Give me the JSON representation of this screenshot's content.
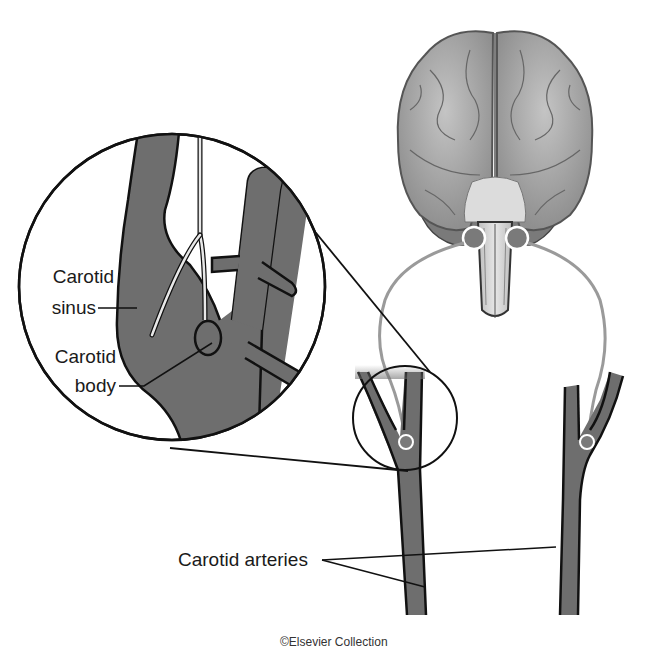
{
  "diagram": {
    "labels": {
      "carotid_sinus_line1": "Carotid",
      "carotid_sinus_line2": "sinus",
      "carotid_body_line1": "Carotid",
      "carotid_body_line2": "body",
      "carotid_arteries": "Carotid arteries"
    },
    "credit": "©Elsevier Collection",
    "colors": {
      "artery_fill": "#6e6e6e",
      "outline": "#111111",
      "nerve": "#9a9a9a",
      "brain_fill": "#a8a8a8",
      "brain_light": "#c9c9c9",
      "brainstem": "#d8d8d8",
      "background": "#ffffff"
    },
    "components": [
      "brain",
      "brainstem",
      "glossopharyngeal nerves",
      "left carotid bifurcation",
      "right carotid bifurcation",
      "magnified inset circle",
      "carotid sinus",
      "carotid body"
    ]
  }
}
